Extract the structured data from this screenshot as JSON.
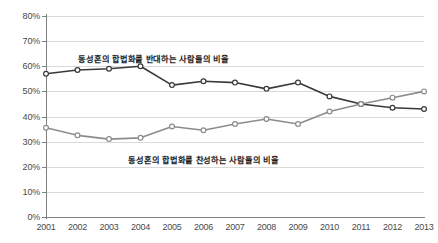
{
  "chart_data": {
    "type": "line",
    "title": "",
    "subtitle": "",
    "xlabel": "",
    "ylabel": "",
    "x": [
      2001,
      2002,
      2003,
      2004,
      2005,
      2006,
      2007,
      2008,
      2009,
      2010,
      2011,
      2012,
      2013
    ],
    "categories": [
      "2001",
      "2002",
      "2003",
      "2004",
      "2005",
      "2006",
      "2007",
      "2008",
      "2009",
      "2010",
      "2011",
      "2012",
      "2013"
    ],
    "ylim": [
      0,
      80
    ],
    "ytick_values": [
      80,
      70,
      60,
      50,
      40,
      30,
      20,
      10,
      0
    ],
    "ytick_labels": [
      "80%",
      "70%",
      "60%",
      "50%",
      "40%",
      "30%",
      "20%",
      "10%",
      "0%"
    ],
    "grid": true,
    "legend_position": "inline-annotation",
    "series": [
      {
        "name": "동성혼의 합법화를 반대하는 사람들의 비율",
        "color": "#3a3a3a",
        "marker": "open-circle",
        "values": [
          57,
          58.5,
          59,
          60,
          52.5,
          54,
          53.5,
          51,
          53.5,
          48,
          45,
          43.5,
          43
        ]
      },
      {
        "name": "동성혼의 합법화를 찬성하는 사람들의 비율",
        "color": "#8c8c8c",
        "marker": "open-circle",
        "values": [
          35.5,
          32.5,
          31,
          31.5,
          36,
          34.5,
          37,
          39,
          37,
          42,
          45,
          47.5,
          50
        ]
      }
    ],
    "annotations": [
      {
        "id": "oppose",
        "text": "동성혼의 합법화를 반대하는 사람들의 비율"
      },
      {
        "id": "support",
        "text": "동성혼의 합법화를 찬성하는 사람들의 비율"
      }
    ]
  }
}
